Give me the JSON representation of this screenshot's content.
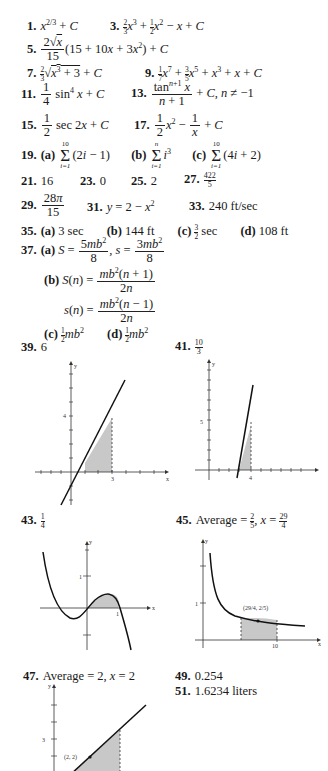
{
  "answers": {
    "a1": {
      "num": "1.",
      "expr": "x^(2/3) + C"
    },
    "a3": {
      "num": "3.",
      "expr": "(2/3)x^3 + (1/2)x^2 - x + C"
    },
    "a5": {
      "num": "5.",
      "expr": "(2√x / 15)(15 + 10x + 3x^2) + C"
    },
    "a7": {
      "num": "7.",
      "expr": "(2/3)√(x^3 + 3) + C"
    },
    "a9": {
      "num": "9.",
      "expr": "(1/7)x^7 + (3/5)x^5 + x^3 + x + C"
    },
    "a11": {
      "num": "11.",
      "expr": "(1/4) sin^4 x + C"
    },
    "a13": {
      "num": "13.",
      "expr": "tan^(n+1) x / (n+1) + C, n ≠ -1"
    },
    "a15": {
      "num": "15.",
      "expr": "(1/2) sec 2x + C"
    },
    "a17": {
      "num": "17.",
      "expr": "(1/2)x^2 - 1/x + C"
    },
    "a19": {
      "num": "19.",
      "a": "Σ_{i=1}^{10} (2i - 1)",
      "b": "Σ_{i=1}^{n} i^3",
      "c": "Σ_{i=1}^{10} (4i + 2)"
    },
    "a21": {
      "num": "21.",
      "value": "16"
    },
    "a23": {
      "num": "23.",
      "value": "0"
    },
    "a25": {
      "num": "25.",
      "value": "2"
    },
    "a27": {
      "num": "27.",
      "value": "422/5"
    },
    "a29": {
      "num": "29.",
      "value": "28π/15"
    },
    "a31": {
      "num": "31.",
      "value": "y = 2 - x^2"
    },
    "a33": {
      "num": "33.",
      "value": "240 ft/sec"
    },
    "a35": {
      "num": "35.",
      "a": "3 sec",
      "b": "144 ft",
      "c": "3/2 sec",
      "d": "108 ft"
    },
    "a37": {
      "num": "37.",
      "a": "S = 5mb^2/8, s = 3mb^2/8",
      "b1": "S(n) = mb^2(n + 1)/2n",
      "b2": "s(n) = mb^2(n - 1)/2n",
      "c": "(1/2)mb^2",
      "d": "(1/2)mb^2"
    },
    "a39": {
      "num": "39.",
      "value": "6"
    },
    "a41": {
      "num": "41.",
      "value": "10/3"
    },
    "a43": {
      "num": "43.",
      "value": "1/4"
    },
    "a45": {
      "num": "45.",
      "value": "Average = 2/5, x = 29/4"
    },
    "a47": {
      "num": "47.",
      "value": "Average = 2, x = 2"
    },
    "a49": {
      "num": "49.",
      "value": "0.254"
    },
    "a51": {
      "num": "51.",
      "value": "1.6234 liters"
    }
  },
  "labels": {
    "part_a": "(a)",
    "part_b": "(b)",
    "part_c": "(c)",
    "part_d": "(d)",
    "plus_c": "+ C",
    "sum_lower": "i=1",
    "sum_upper_10": "10",
    "sum_upper_n": "n"
  },
  "graphs": {
    "g39": {
      "y_tick": "4",
      "x_tick": "3",
      "axis_x": "x",
      "axis_y": "y"
    },
    "g41": {
      "y_tick": "5",
      "x_tick": "4",
      "axis_x": "x",
      "axis_y": "y"
    },
    "g43": {
      "y_tick": "1",
      "x_tick": "1",
      "axis_x": "x",
      "axis_y": "y"
    },
    "g45": {
      "y_tick": "1",
      "x_tick": "10",
      "point_label": "(29/4, 2/5)",
      "axis_x": "x",
      "axis_y": "y"
    },
    "g47": {
      "y_tick": "3",
      "point_label": "(2, 2)",
      "axis_x": "x",
      "axis_y": "y"
    }
  }
}
